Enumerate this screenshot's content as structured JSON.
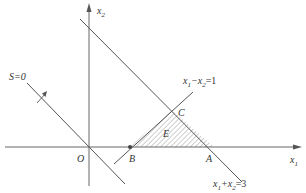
{
  "diagram": {
    "type": "linear-programming-feasible-region",
    "colors": {
      "line": "#555555",
      "hatch": "#777777",
      "text": "#333333",
      "point": "#444444"
    },
    "axes": {
      "x_label": "x",
      "x_sub": "1",
      "y_label": "x",
      "y_sub": "2",
      "origin_label": "O"
    },
    "lines": [
      {
        "id": "objective",
        "label": "S=0"
      },
      {
        "id": "constraint1",
        "label_parts": [
          "x",
          "1",
          "−x",
          "2",
          "=1"
        ]
      },
      {
        "id": "constraint2",
        "label_parts": [
          "x",
          "1",
          "+x",
          "2",
          "=3"
        ]
      }
    ],
    "points": {
      "A": "A",
      "B": "B",
      "C": "C"
    },
    "region_label": "E"
  }
}
